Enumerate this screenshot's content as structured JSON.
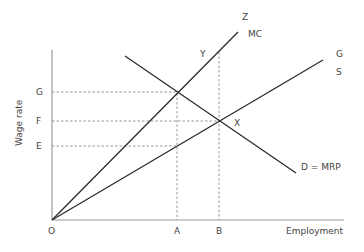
{
  "diagram": {
    "axes": {
      "x_label": "Employment",
      "y_label": "Wage rate",
      "origin_label": "O"
    },
    "y_ticks": [
      {
        "label": "G",
        "y": 92
      },
      {
        "label": "F",
        "y": 121
      },
      {
        "label": "E",
        "y": 146
      }
    ],
    "x_ticks": [
      {
        "label": "A",
        "x": 177
      },
      {
        "label": "B",
        "x": 219
      }
    ],
    "curves": [
      {
        "name": "MC",
        "top_label": "Z",
        "label": "MC"
      },
      {
        "name": "S",
        "top_label": "G",
        "label": "S"
      },
      {
        "name": "D",
        "label": "D = MRP"
      }
    ],
    "points": [
      {
        "label": "X"
      },
      {
        "label": "Y"
      }
    ],
    "colors": {
      "line": "#2b2b2b",
      "axis": "#9a9a9a",
      "dash": "#8a8a8a",
      "text": "#444444"
    }
  }
}
